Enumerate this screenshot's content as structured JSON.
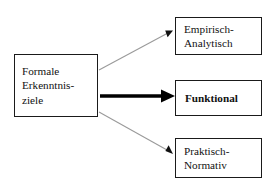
{
  "diagram": {
    "title_text": "",
    "background_color": "#ffffff",
    "nodes": {
      "source": {
        "id": "formale-erkenntnisziele",
        "lines": [
          "Formale",
          "Erkenntnis-",
          "ziele"
        ],
        "border_color": "#1a1a1a",
        "fill_color": "#ffffff",
        "text_color": "#111111",
        "emphasis": "normal"
      },
      "empirisch": {
        "id": "empirisch-analytisch",
        "lines": [
          "Empirisch-",
          "Analytisch"
        ],
        "border_color": "#1a1a1a",
        "fill_color": "#ffffff",
        "text_color": "#111111",
        "emphasis": "normal"
      },
      "funktional": {
        "id": "funktional",
        "lines": [
          "Funktional"
        ],
        "border_color": "#1a1a1a",
        "fill_color": "#ffffff",
        "text_color": "#111111",
        "emphasis": "bold"
      },
      "praktisch": {
        "id": "praktisch-normativ",
        "lines": [
          "Praktisch-",
          "Normativ"
        ],
        "border_color": "#1a1a1a",
        "fill_color": "#ffffff",
        "text_color": "#111111",
        "emphasis": "normal"
      }
    },
    "edges": [
      {
        "id": "edge-to-empirisch",
        "from": "formale-erkenntnisziele",
        "to": "empirisch-analytisch",
        "label": "",
        "style": "thin",
        "color": "#9a9a9a",
        "width": 1,
        "direction": "up-right",
        "arrowhead": "filled-triangle"
      },
      {
        "id": "edge-to-funktional",
        "from": "formale-erkenntnisziele",
        "to": "funktional",
        "label": "",
        "style": "thick",
        "color": "#000000",
        "width": 4,
        "direction": "right",
        "arrowhead": "filled-triangle"
      },
      {
        "id": "edge-to-praktisch",
        "from": "formale-erkenntnisziele",
        "to": "praktisch-normativ",
        "label": "",
        "style": "thin",
        "color": "#9a9a9a",
        "width": 1,
        "direction": "down-right",
        "arrowhead": "filled-triangle"
      }
    ]
  }
}
